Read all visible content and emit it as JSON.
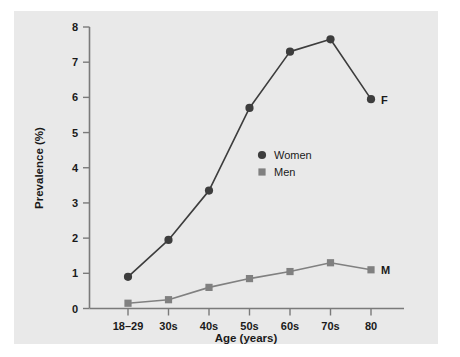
{
  "chart_data": {
    "type": "line",
    "title": "",
    "xlabel": "Age (years)",
    "ylabel": "Prevalence (%)",
    "categories": [
      "18–29",
      "30s",
      "40s",
      "50s",
      "60s",
      "70s",
      "80"
    ],
    "ylim": [
      0,
      8
    ],
    "yticks": [
      "0",
      "1",
      "2",
      "3",
      "4",
      "5",
      "6",
      "7",
      "8"
    ],
    "grid": false,
    "legend_position": "center",
    "series": [
      {
        "name": "Women",
        "marker": "circle",
        "color": "#3d3d3d",
        "end_annotation": "F",
        "values": [
          0.9,
          1.95,
          3.35,
          5.7,
          7.3,
          7.65,
          5.95
        ]
      },
      {
        "name": "Men",
        "marker": "square",
        "color": "#808080",
        "end_annotation": "M",
        "values": [
          0.15,
          0.25,
          0.6,
          0.85,
          1.05,
          1.3,
          1.1
        ]
      }
    ]
  },
  "legend": {
    "items": [
      {
        "label": "Women"
      },
      {
        "label": "Men"
      }
    ]
  },
  "annotations": {
    "women_end": "F",
    "men_end": "M"
  },
  "colors": {
    "panel_background": "#e9e9e9",
    "figure_background": "#ffffff",
    "axis": "#7a7a7a",
    "women": "#3d3d3d",
    "men": "#808080",
    "text": "#1a1a1a"
  }
}
